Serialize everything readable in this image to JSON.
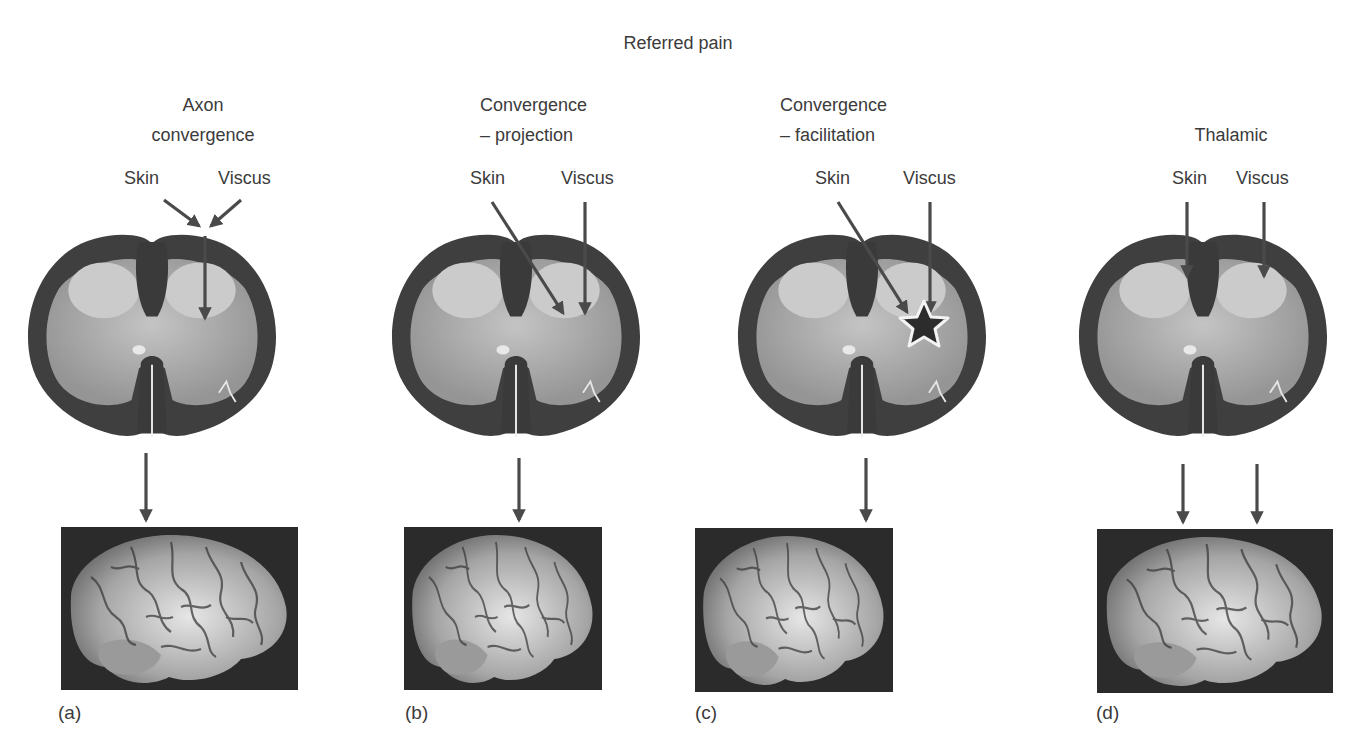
{
  "figure": {
    "title": "Referred pain",
    "colors": {
      "arrow": "#4a4a4a",
      "text": "#3b3b3b",
      "cord_white_matter": "#3d3d3d",
      "cord_grey_matter": "#a9a9a9",
      "dorsal_horn": "#c9c9c9",
      "brain_background": "#2b2b2b",
      "brain_tissue": "#b8b8b8"
    },
    "panels": [
      {
        "id": "a",
        "label": "(a)",
        "heading": [
          "Axon",
          "convergence"
        ],
        "inputs": [
          "Skin",
          "Viscus"
        ],
        "mechanism": "Skin and viscus axons converge into a single axon before entering the dorsal horn",
        "output_arrows": 1,
        "has_star": false
      },
      {
        "id": "b",
        "label": "(b)",
        "heading": [
          "Convergence",
          "– projection"
        ],
        "inputs": [
          "Skin",
          "Viscus"
        ],
        "mechanism": "Skin and viscus afferents converge on the same dorsal horn neuron",
        "output_arrows": 1,
        "has_star": false
      },
      {
        "id": "c",
        "label": "(c)",
        "heading": [
          "Convergence",
          "– facilitation"
        ],
        "inputs": [
          "Skin",
          "Viscus"
        ],
        "mechanism": "Visceral input facilitates (star) dorsal horn neurons receiving skin input",
        "output_arrows": 1,
        "has_star": true
      },
      {
        "id": "d",
        "label": "(d)",
        "heading": [
          "Thalamic"
        ],
        "inputs": [
          "Skin",
          "Viscus"
        ],
        "mechanism": "Separate pathways from skin and viscus project to the brain and converge at thalamic level",
        "output_arrows": 2,
        "has_star": false
      }
    ]
  }
}
